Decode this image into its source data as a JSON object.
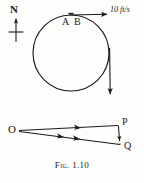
{
  "figure": {
    "caption_prefix": "Fig.",
    "caption_number": "1.10",
    "caption_full": "Fig. 1.10"
  },
  "upper_diagram": {
    "name": "circular-path-with-velocity-vectors",
    "compass": {
      "label": "N",
      "direction": "north",
      "icon": "compass-north-arrow-icon"
    },
    "circle": {
      "center_x": 71,
      "center_y": 53,
      "radius": 38
    },
    "points": [
      {
        "label": "A",
        "x": 66,
        "y": 15
      },
      {
        "label": "B",
        "x": 76,
        "y": 15
      }
    ],
    "vectors": [
      {
        "name": "velocity-at-A",
        "label": "10 ft/s",
        "magnitude": 10,
        "unit": "ft/s",
        "direction": "east",
        "from_x": 70,
        "from_y": 15,
        "to_x": 108,
        "to_y": 15
      },
      {
        "name": "velocity-at-B",
        "label": "",
        "magnitude": 10,
        "unit": "ft/s",
        "direction": "south",
        "from_x": 110,
        "from_y": 48,
        "to_x": 110,
        "to_y": 96
      }
    ]
  },
  "lower_diagram": {
    "name": "vector-triangle-OPQ",
    "points": [
      {
        "label": "O",
        "x": 16,
        "y": 131
      },
      {
        "label": "P",
        "x": 119,
        "y": 125
      },
      {
        "label": "Q",
        "x": 121,
        "y": 145
      }
    ],
    "vectors": [
      {
        "name": "OP",
        "from": "O",
        "to": "P",
        "arrow_count": 1
      },
      {
        "name": "OQ",
        "from": "O",
        "to": "Q",
        "arrow_count": 2
      },
      {
        "name": "PQ",
        "from": "P",
        "to": "Q",
        "arrow_count": 1
      }
    ]
  },
  "colors": {
    "ink": "#1a1a1a",
    "background": "#fdfdfc"
  }
}
